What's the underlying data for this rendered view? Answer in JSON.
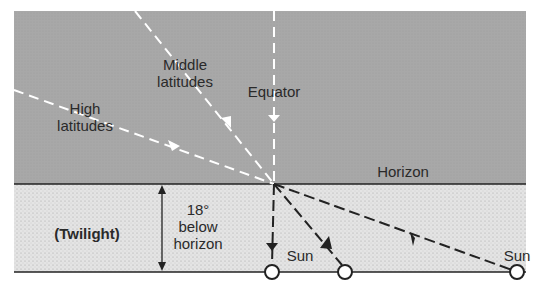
{
  "diagram": {
    "title": "",
    "sky_labels": {
      "middle_latitudes": [
        "Middle",
        "latitudes"
      ],
      "high_latitudes": [
        "High",
        "latitudes"
      ],
      "equator": "Equator",
      "horizon": "Horizon"
    },
    "twilight_band": {
      "label": "(Twilight)",
      "depth_label": [
        "18°",
        "below",
        "horizon"
      ]
    },
    "sun_labels": [
      "Sun",
      "Sun"
    ],
    "colors": {
      "sky": "#a9a9a9",
      "twilight_band": "#e6e6e6",
      "sky_lines": "#ffffff",
      "band_lines": "#222222"
    }
  }
}
